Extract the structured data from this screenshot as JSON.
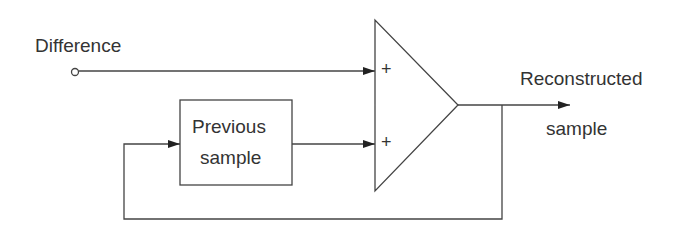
{
  "diagram": {
    "input_label": "Difference",
    "block_label_line1": "Previous",
    "block_label_line2": "sample",
    "plus_top": "+",
    "plus_bottom": "+",
    "output_label_line1": "Reconstructed",
    "output_label_line2": "sample"
  }
}
